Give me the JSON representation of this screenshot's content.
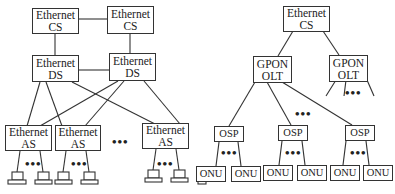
{
  "left_network": {
    "cs": [
      {
        "line1": "Ethernet",
        "line2": "CS"
      },
      {
        "line1": "Ethernet",
        "line2": "CS"
      }
    ],
    "ds": [
      {
        "line1": "Ethernet",
        "line2": "DS"
      },
      {
        "line1": "Ethernet",
        "line2": "DS"
      }
    ],
    "as": [
      {
        "line1": "Ethernet",
        "line2": "AS"
      },
      {
        "line1": "Ethernet",
        "line2": "AS"
      },
      {
        "line1": "Ethernet",
        "line2": "AS"
      }
    ],
    "ellipsis": "•••",
    "terminal_icon": "computer-terminal-icon"
  },
  "right_network": {
    "cs": {
      "line1": "Ethernet",
      "line2": "CS"
    },
    "olt": [
      {
        "line1": "GPON",
        "line2": "OLT"
      },
      {
        "line1": "GPON",
        "line2": "OLT"
      }
    ],
    "osp": [
      "OSP",
      "OSP",
      "OSP"
    ],
    "onu": [
      "ONU",
      "ONU",
      "ONU",
      "ONU",
      "ONU",
      "ONU"
    ],
    "ellipsis": "•••"
  },
  "colors": {
    "line": "#333333",
    "background": "#ffffff"
  }
}
